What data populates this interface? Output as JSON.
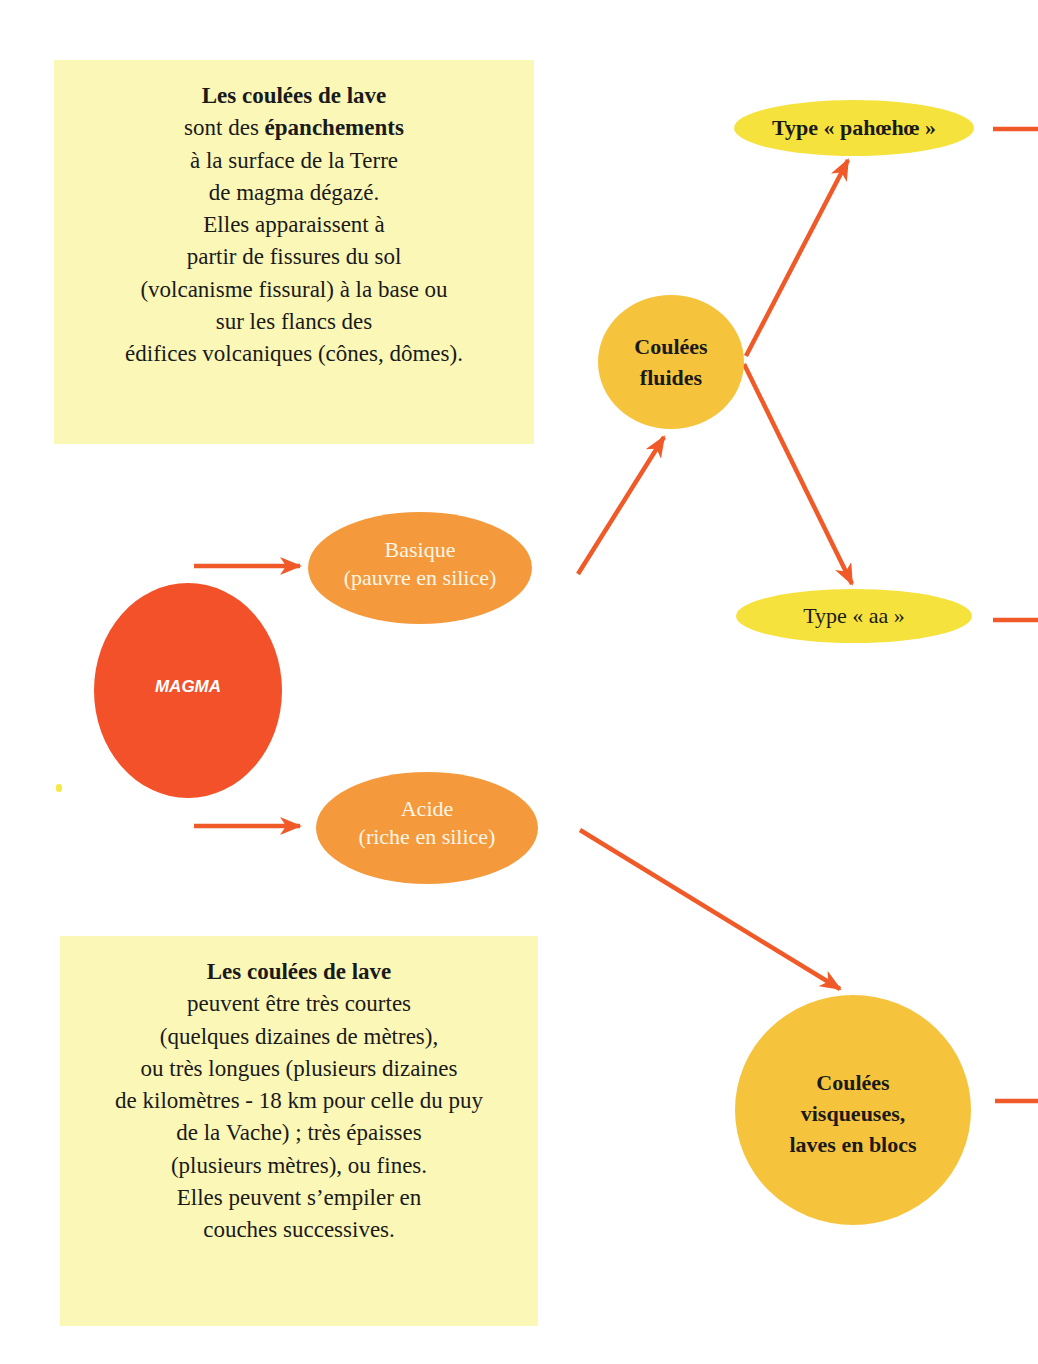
{
  "diagram": {
    "colors": {
      "infobox_bg": "#fbf7b6",
      "magma": "#f2512a",
      "composition_oval": "#f49a3c",
      "flow_circle": "#f6c43c",
      "type_oval": "#f6e23c",
      "arrow": "#f05a28"
    },
    "info_top": {
      "title": "Les coulées de lave",
      "line1_prefix": "sont des ",
      "line1_bold": "épanchements",
      "lines": [
        "à la surface de la Terre",
        "de magma dégazé.",
        "Elles apparaissent à",
        "partir de fissures du sol",
        "(volcanisme fissural) à la base ou",
        "sur les flancs des",
        "édifices volcaniques (cônes, dômes)."
      ]
    },
    "info_bottom": {
      "title": "Les coulées de lave",
      "lines": [
        "peuvent être très courtes",
        "(quelques dizaines de mètres),",
        "ou très longues (plusieurs dizaines",
        "de kilomètres - 18 km pour celle du puy",
        "de la Vache) ; très épaisses",
        "(plusieurs mètres), ou fines.",
        "Elles peuvent s’empiler en",
        "couches successives."
      ]
    },
    "nodes": {
      "magma": "MAGMA",
      "basique": {
        "line1": "Basique",
        "line2": "(pauvre en silice)"
      },
      "acide": {
        "line1": "Acide",
        "line2": "(riche en silice)"
      },
      "fluides": {
        "line1": "Coulées",
        "line2": "fluides"
      },
      "visqueuses": {
        "line1": "Coulées",
        "line2": "visqueuses,",
        "line3": "laves en blocs"
      },
      "pahoehoe": "Type « pahœhœ »",
      "aa": "Type « aa »"
    },
    "edges": [
      {
        "from": "magma",
        "to": "basique"
      },
      {
        "from": "magma",
        "to": "acide"
      },
      {
        "from": "basique",
        "to": "fluides"
      },
      {
        "from": "fluides",
        "to": "pahoehoe"
      },
      {
        "from": "fluides",
        "to": "aa"
      },
      {
        "from": "acide",
        "to": "visqueuses"
      },
      {
        "from": "pahoehoe",
        "to": "offpage"
      },
      {
        "from": "aa",
        "to": "offpage"
      },
      {
        "from": "visqueuses",
        "to": "offpage"
      }
    ]
  }
}
